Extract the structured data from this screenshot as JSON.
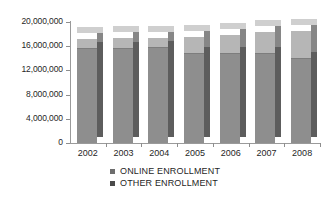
{
  "chart_data": {
    "type": "bar",
    "subtype": "stacked-column-3d",
    "title": "",
    "xlabel": "",
    "ylabel": "",
    "categories": [
      "2002",
      "2003",
      "2004",
      "2005",
      "2006",
      "2007",
      "2008"
    ],
    "series": [
      {
        "name": "OTHER ENROLLMENT",
        "color": "#8e8e8e",
        "values": [
          15700000,
          15700000,
          15800000,
          14800000,
          14800000,
          14800000,
          14000000
        ]
      },
      {
        "name": "ONLINE ENROLLMENT",
        "color": "#b6b6b6",
        "values": [
          1500000,
          1600000,
          1600000,
          2800000,
          3100000,
          3500000,
          4500000
        ]
      }
    ],
    "totals": [
      17200000,
      17300000,
      17400000,
      17600000,
      17900000,
      18300000,
      18500000
    ],
    "ylim": [
      0,
      20000000
    ],
    "ytick_values": [
      0,
      4000000,
      8000000,
      12000000,
      16000000,
      20000000
    ],
    "ytick_labels": [
      "0",
      "4,000,000",
      "8,000,000",
      "12,000,000",
      "16,000,000",
      "20,000,000"
    ],
    "grid": false,
    "legend_position": "bottom",
    "legend": [
      {
        "label": "ONLINE ENROLLMENT",
        "swatch_color": "#6d6d6d"
      },
      {
        "label": "OTHER ENROLLMENT",
        "swatch_color": "#4a4a4a"
      }
    ]
  }
}
